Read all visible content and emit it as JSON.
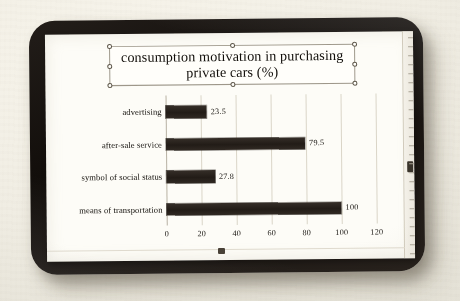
{
  "app": {
    "kind": "slide-chart-editor",
    "selected_object": "chart-title-textbox"
  },
  "title": {
    "line1": "consumption  motivation in purchasing",
    "line2": "private cars (%)",
    "full": "consumption  motivation in purchasing\nprivate cars (%)"
  },
  "colors": {
    "bar": "#2b241e",
    "canvas": "#fbfaf5",
    "bezel": "#17120f",
    "gridline": "#d8d3c6",
    "backdrop": "#eeebe1",
    "handle_fill": "#fffef9",
    "handle_stroke": "#5d564a"
  },
  "chart_data": {
    "type": "bar",
    "orientation": "horizontal",
    "title": "consumption  motivation in purchasing private cars (%)",
    "categories": [
      "advertising",
      "after-sale service",
      "symbol of social status",
      "means of transportation"
    ],
    "values": [
      23.5,
      79.5,
      27.8,
      100
    ],
    "data_labels": [
      "23.5",
      "79.5",
      "27.8",
      "100"
    ],
    "xlabel": "",
    "ylabel": "",
    "xlim": [
      0,
      120
    ],
    "xticks": [
      0,
      20,
      40,
      60,
      80,
      100,
      120
    ],
    "xtick_labels": [
      "0",
      "20",
      "40",
      "60",
      "80",
      "100",
      "120"
    ],
    "grid": true,
    "grid_axis": "x",
    "legend": false,
    "legend_position": "none"
  },
  "ruler": {
    "name": "vertical-ruler",
    "thumb_visible": true
  }
}
